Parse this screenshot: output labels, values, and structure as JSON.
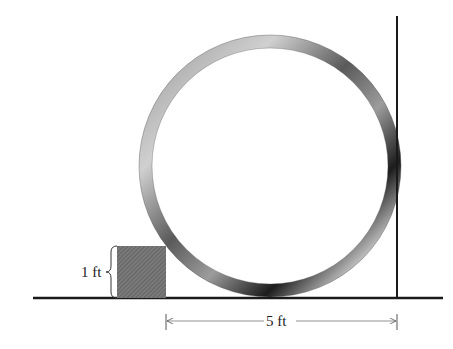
{
  "diagram": {
    "title": "",
    "labels": {
      "box_height": "1 ft",
      "distance": "5 ft"
    },
    "elements": {
      "ground": {
        "x1": 33,
        "x2": 443,
        "y": 298
      },
      "wall": {
        "x": 397,
        "y1": 16,
        "y2": 298
      },
      "ring": {
        "cx": 270,
        "cy": 166,
        "r_outer": 131,
        "thickness": 13
      },
      "box": {
        "x": 117,
        "y": 246,
        "width": 49,
        "height": 52
      },
      "dimension_line": {
        "x1": 166,
        "x2": 397,
        "y": 321
      }
    },
    "colors": {
      "line": "#1a1a1a",
      "box_fill": "#6e6e6e",
      "ring_dark": "#111111",
      "ring_light": "#d8d8d8",
      "dimension": "#555555"
    }
  }
}
